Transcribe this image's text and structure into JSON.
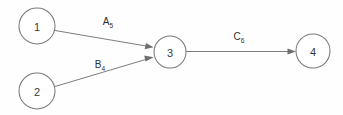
{
  "diagram": {
    "background_color": "#fefefe",
    "stroke_color": "#7a7a7a",
    "text_color": "#2f2f2f",
    "nodes": [
      {
        "id": "1",
        "label": "1",
        "cx": 37,
        "cy": 26,
        "r": 18
      },
      {
        "id": "2",
        "label": "2",
        "cx": 37,
        "cy": 91,
        "r": 18
      },
      {
        "id": "3",
        "label": "3",
        "cx": 170,
        "cy": 52,
        "r": 16
      },
      {
        "id": "4",
        "label": "4",
        "cx": 313,
        "cy": 51,
        "r": 17
      }
    ],
    "edges": [
      {
        "id": "edge-1-3",
        "from": "1",
        "to": "3",
        "label_base": "A",
        "label_sub": "5",
        "label_text": "A5",
        "label_x": 108,
        "label_y": 25
      },
      {
        "id": "edge-2-3",
        "from": "2",
        "to": "3",
        "label_base": "B",
        "label_sub": "4",
        "label_text": "B4",
        "label_x": 100,
        "label_y": 68
      },
      {
        "id": "edge-3-4",
        "from": "3",
        "to": "4",
        "label_base": "C",
        "label_sub": "6",
        "label_text": "C6",
        "label_x": 239,
        "label_y": 40
      }
    ]
  }
}
